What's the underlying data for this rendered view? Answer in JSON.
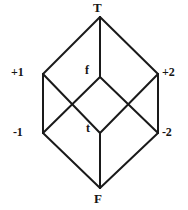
{
  "figure": {
    "kind": "hasse-diagram",
    "stroke_color": "#1a1a1a",
    "text_color": "#151515",
    "background_color": "#ffffff",
    "width": 188,
    "height": 210
  },
  "nodes": [
    {
      "id": "top",
      "label": "T",
      "x": 100,
      "y": 17,
      "label_x": 93,
      "label_y": 1,
      "label_class": "lbl-top"
    },
    {
      "id": "plus-one",
      "label": "+1",
      "x": 43,
      "y": 74,
      "label_x": 11,
      "label_y": 66,
      "label_class": "lbl-side"
    },
    {
      "id": "false-f",
      "label": "f",
      "x": 100,
      "y": 77,
      "label_x": 85,
      "label_y": 64,
      "label_class": "lbl-mid"
    },
    {
      "id": "plus-two",
      "label": "+2",
      "x": 158,
      "y": 74,
      "label_x": 162,
      "label_y": 66,
      "label_class": "lbl-side"
    },
    {
      "id": "minus-one",
      "label": "-1",
      "x": 43,
      "y": 133,
      "label_x": 13,
      "label_y": 126,
      "label_class": "lbl-side"
    },
    {
      "id": "true-t",
      "label": "t",
      "x": 100,
      "y": 133,
      "label_x": 86,
      "label_y": 122,
      "label_class": "lbl-mid"
    },
    {
      "id": "minus-two",
      "label": "-2",
      "x": 158,
      "y": 133,
      "label_x": 162,
      "label_y": 126,
      "label_class": "lbl-side"
    },
    {
      "id": "bottom",
      "label": "F",
      "x": 100,
      "y": 188,
      "label_x": 94,
      "label_y": 192,
      "label_class": "lbl-bottom"
    }
  ],
  "edges": [
    {
      "id": "edge-top-plusone",
      "from": "top",
      "to": "plus-one"
    },
    {
      "id": "edge-top-plustwo",
      "from": "top",
      "to": "plus-two"
    },
    {
      "id": "edge-top-f",
      "from": "top",
      "to": "false-f"
    },
    {
      "id": "edge-plusone-minusone",
      "from": "plus-one",
      "to": "minus-one"
    },
    {
      "id": "edge-plustwo-minustwo",
      "from": "plus-two",
      "to": "minus-two"
    },
    {
      "id": "edge-plusone-t",
      "from": "plus-one",
      "to": "true-t"
    },
    {
      "id": "edge-minusone-f",
      "from": "minus-one",
      "to": "false-f"
    },
    {
      "id": "edge-plustwo-t",
      "from": "plus-two",
      "to": "true-t"
    },
    {
      "id": "edge-minustwo-f",
      "from": "minus-two",
      "to": "false-f"
    },
    {
      "id": "edge-t-bottom",
      "from": "true-t",
      "to": "bottom"
    },
    {
      "id": "edge-minusone-bottom",
      "from": "minus-one",
      "to": "bottom"
    },
    {
      "id": "edge-minustwo-bottom",
      "from": "minus-two",
      "to": "bottom"
    }
  ]
}
